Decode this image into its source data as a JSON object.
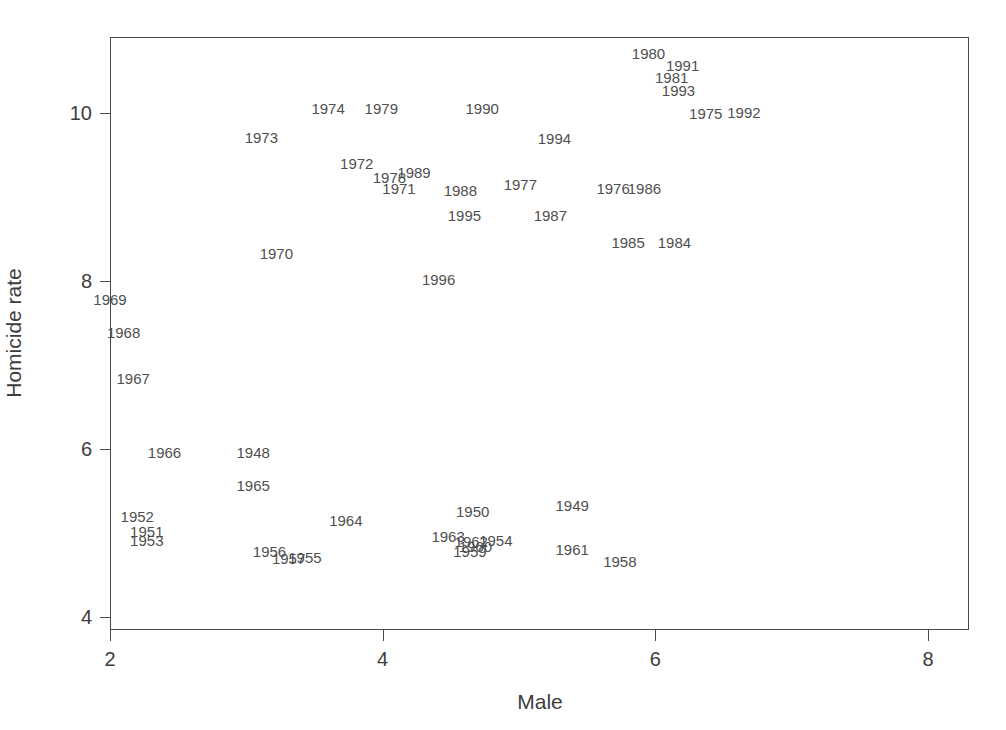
{
  "chart_data": {
    "type": "scatter",
    "title": "",
    "xlabel": "Male",
    "ylabel": "Homicide rate",
    "xlim": [
      1.73,
      8.99
    ],
    "ylim": [
      3.78,
      10.84
    ],
    "xticks": [
      2,
      4,
      6,
      8
    ],
    "xticklabels": [
      "2",
      "4",
      "6",
      "8"
    ],
    "yticks": [
      4,
      6,
      8,
      10
    ],
    "yticklabels": [
      "4",
      "6",
      "8",
      "10"
    ],
    "grid": false,
    "legend": null,
    "marker": "text-label",
    "note": "Each data point is rendered as its year label text rather than a marker glyph.",
    "points": [
      {
        "label": "1948",
        "x": 3.05,
        "y": 5.97
      },
      {
        "label": "1949",
        "x": 5.39,
        "y": 5.33
      },
      {
        "label": "1950",
        "x": 4.66,
        "y": 5.26
      },
      {
        "label": "1951",
        "x": 2.27,
        "y": 5.02
      },
      {
        "label": "1952",
        "x": 2.2,
        "y": 5.2
      },
      {
        "label": "1953",
        "x": 2.27,
        "y": 4.92
      },
      {
        "label": "1954",
        "x": 4.83,
        "y": 4.92
      },
      {
        "label": "1955",
        "x": 3.43,
        "y": 4.72
      },
      {
        "label": "1956",
        "x": 3.17,
        "y": 4.78
      },
      {
        "label": "1957",
        "x": 3.31,
        "y": 4.7
      },
      {
        "label": "1958",
        "x": 5.74,
        "y": 4.67
      },
      {
        "label": "1959",
        "x": 4.64,
        "y": 4.78
      },
      {
        "label": "1960",
        "x": 4.68,
        "y": 4.85
      },
      {
        "label": "1961",
        "x": 5.39,
        "y": 4.81
      },
      {
        "label": "1962",
        "x": 4.65,
        "y": 4.9
      },
      {
        "label": "1963",
        "x": 4.48,
        "y": 4.97
      },
      {
        "label": "1964",
        "x": 3.73,
        "y": 5.15
      },
      {
        "label": "1965",
        "x": 3.05,
        "y": 5.57
      },
      {
        "label": "1966",
        "x": 2.4,
        "y": 5.96
      },
      {
        "label": "1967",
        "x": 2.17,
        "y": 6.85
      },
      {
        "label": "1968",
        "x": 2.1,
        "y": 7.39
      },
      {
        "label": "1969",
        "x": 2.0,
        "y": 7.78
      },
      {
        "label": "1970",
        "x": 3.22,
        "y": 8.33
      },
      {
        "label": "1971",
        "x": 4.12,
        "y": 9.11
      },
      {
        "label": "1972",
        "x": 3.81,
        "y": 9.4
      },
      {
        "label": "1973",
        "x": 3.11,
        "y": 9.72
      },
      {
        "label": "1974",
        "x": 3.6,
        "y": 10.06
      },
      {
        "label": "1975",
        "x": 6.37,
        "y": 10.0
      },
      {
        "label": "1976",
        "x": 5.69,
        "y": 9.11
      },
      {
        "label": "1977",
        "x": 5.01,
        "y": 9.15
      },
      {
        "label": "1978",
        "x": 4.05,
        "y": 9.24
      },
      {
        "label": "1979",
        "x": 3.99,
        "y": 10.06
      },
      {
        "label": "1980",
        "x": 5.95,
        "y": 10.72
      },
      {
        "label": "1981",
        "x": 6.12,
        "y": 10.43
      },
      {
        "label": "1982",
        "x": 8.72,
        "y": 9.7
      },
      {
        "label": "1983",
        "x": 8.71,
        "y": 8.76
      },
      {
        "label": "1984",
        "x": 6.14,
        "y": 8.46
      },
      {
        "label": "1985",
        "x": 5.8,
        "y": 8.46
      },
      {
        "label": "1986",
        "x": 5.92,
        "y": 9.11
      },
      {
        "label": "1987",
        "x": 5.23,
        "y": 8.79
      },
      {
        "label": "1988",
        "x": 4.57,
        "y": 9.08
      },
      {
        "label": "1989",
        "x": 4.23,
        "y": 9.3
      },
      {
        "label": "1990",
        "x": 4.73,
        "y": 10.06
      },
      {
        "label": "1991",
        "x": 6.2,
        "y": 10.57
      },
      {
        "label": "1992",
        "x": 6.65,
        "y": 10.01
      },
      {
        "label": "1993",
        "x": 6.17,
        "y": 10.27
      },
      {
        "label": "1994",
        "x": 5.26,
        "y": 9.7
      },
      {
        "label": "1995",
        "x": 4.6,
        "y": 8.79
      },
      {
        "label": "1996",
        "x": 4.41,
        "y": 8.02
      }
    ]
  }
}
